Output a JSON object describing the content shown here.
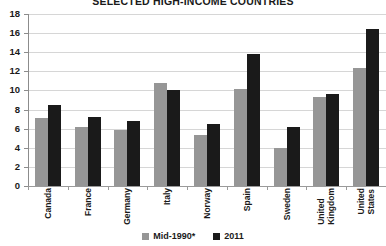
{
  "chart_data": {
    "type": "bar",
    "title": "SELECTED HIGH-INCOME COUNTRIES",
    "xlabel": "",
    "ylabel": "",
    "ylim": [
      0,
      18
    ],
    "ytick_step": 2,
    "yticks": [
      "0",
      "2",
      "4",
      "6",
      "8",
      "10",
      "12",
      "14",
      "16",
      "18"
    ],
    "grid": true,
    "legend_position": "bottom-center",
    "categories": [
      "Canada",
      "France",
      "Germany",
      "Italy",
      "Norway",
      "Spain",
      "Sweden",
      "United Kingdom",
      "United States"
    ],
    "series": [
      {
        "name": "Mid-1990*",
        "color": "#969696",
        "values": [
          7.1,
          6.2,
          5.9,
          10.8,
          5.3,
          10.2,
          4.0,
          9.3,
          12.3
        ]
      },
      {
        "name": "2011",
        "color": "#1a1a1a",
        "values": [
          8.5,
          7.2,
          6.8,
          10.1,
          6.5,
          13.8,
          6.2,
          9.6,
          16.4
        ]
      }
    ]
  },
  "colors": {
    "series_mid1990": "#969696",
    "series_2011": "#1a1a1a",
    "gridline": "#d6d6d6",
    "axis": "#8c8c8c",
    "background": "#ffffff",
    "text": "#1a1a1a"
  }
}
